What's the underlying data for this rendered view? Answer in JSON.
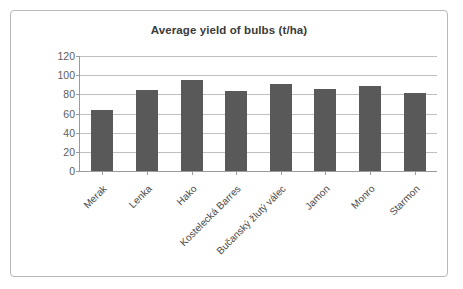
{
  "chart_data": {
    "type": "bar",
    "title": "Average yield of bulbs (t/ha)",
    "xlabel": "",
    "ylabel": "",
    "ylim": [
      0,
      120
    ],
    "yticks": [
      0,
      20,
      40,
      60,
      80,
      100,
      120
    ],
    "grid": true,
    "legend": false,
    "legend_position": "none",
    "categories": [
      "Merak",
      "Lenka",
      "Hako",
      "Kostelecká Barres",
      "Bučanský žlutý válec",
      "Jamon",
      "Monro",
      "Starmon"
    ],
    "values": [
      64,
      85,
      95,
      83,
      91,
      86,
      89,
      81
    ],
    "series": [
      {
        "name": "Average yield",
        "values": [
          64,
          85,
          95,
          83,
          91,
          86,
          89,
          81
        ]
      }
    ]
  },
  "style": {
    "bar_color": "#595959",
    "gridline_color": "#bfbfbf",
    "axis_color": "#9a9a9a",
    "title_color": "#3a3a3a",
    "tick_label_color": "#5d5d5d",
    "category_label_color": "#4a4a4a",
    "frame_color": "#b8b8b8",
    "background": "#ffffff"
  }
}
